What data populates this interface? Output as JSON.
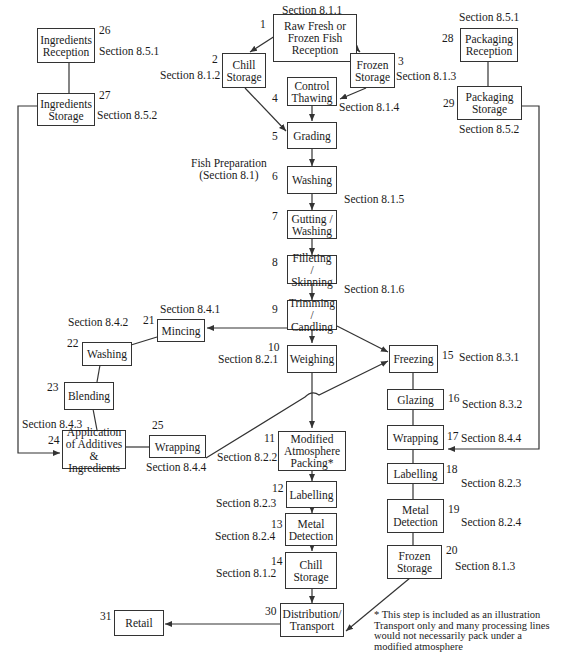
{
  "diagram": {
    "group_label": "Fish Preparation\n(Section 8.1)",
    "footnote": "* This step is included as an illustration Transport only and many processing lines would not necessarily pack under a modified atmosphere",
    "nodes": [
      {
        "id": 1,
        "num": "1",
        "label": "Raw Fresh or Frozen Fish Reception",
        "section": "Section 8.1.1"
      },
      {
        "id": 2,
        "num": "2",
        "label": "Chill Storage",
        "section": "Section 8.1.2"
      },
      {
        "id": 3,
        "num": "3",
        "label": "Frozen Storage",
        "section": "Section 8.1.3"
      },
      {
        "id": 4,
        "num": "4",
        "label": "Control Thawing",
        "section": "Section 8.1.4"
      },
      {
        "id": 5,
        "num": "5",
        "label": "Grading",
        "section": ""
      },
      {
        "id": 6,
        "num": "6",
        "label": "Washing",
        "section": ""
      },
      {
        "id": 7,
        "num": "7",
        "label": "Gutting / Washing",
        "section": "Section 8.1.5"
      },
      {
        "id": 8,
        "num": "8",
        "label": "Filleting / Skinning",
        "section": "Section 8.1.6"
      },
      {
        "id": 9,
        "num": "9",
        "label": "Trimming / Candling",
        "section": ""
      },
      {
        "id": 10,
        "num": "10",
        "label": "Weighing",
        "section": "Section 8.2.1"
      },
      {
        "id": 11,
        "num": "11",
        "label": "Modified Atmosphere Packing*",
        "section": "Section 8.2.2"
      },
      {
        "id": 12,
        "num": "12",
        "label": "Labelling",
        "section": "Section 8.2.3"
      },
      {
        "id": 13,
        "num": "13",
        "label": "Metal Detection",
        "section": "Section 8.2.4"
      },
      {
        "id": 14,
        "num": "14",
        "label": "Chill Storage",
        "section": "Section 8.1.2"
      },
      {
        "id": 15,
        "num": "15",
        "label": "Freezing",
        "section": "Section 8.3.1"
      },
      {
        "id": 16,
        "num": "16",
        "label": "Glazing",
        "section": "Section 8.3.2"
      },
      {
        "id": 17,
        "num": "17",
        "label": "Wrapping",
        "section": "Section 8.4.4"
      },
      {
        "id": 18,
        "num": "18",
        "label": "Labelling",
        "section": "Section 8.2.3"
      },
      {
        "id": 19,
        "num": "19",
        "label": "Metal Detection",
        "section": "Section 8.2.4"
      },
      {
        "id": 20,
        "num": "20",
        "label": "Frozen Storage",
        "section": "Section 8.1.3"
      },
      {
        "id": 21,
        "num": "21",
        "label": "Mincing",
        "section": "Section 8.4.1"
      },
      {
        "id": 22,
        "num": "22",
        "label": "Washing",
        "section": "Section 8.4.2"
      },
      {
        "id": 23,
        "num": "23",
        "label": "Blending",
        "section": ""
      },
      {
        "id": 24,
        "num": "24",
        "label": "Application of Additives & Ingredients",
        "section": "Section 8.4.3"
      },
      {
        "id": 25,
        "num": "25",
        "label": "Wrapping",
        "section": "Section 8.4.4"
      },
      {
        "id": 26,
        "num": "26",
        "label": "Ingredients Reception",
        "section": "Section 8.5.1"
      },
      {
        "id": 27,
        "num": "27",
        "label": "Ingredients Storage",
        "section": "Section 8.5.2"
      },
      {
        "id": 28,
        "num": "28",
        "label": "Packaging Reception",
        "section": "Section 8.5.1"
      },
      {
        "id": 29,
        "num": "29",
        "label": "Packaging Storage",
        "section": "Section 8.5.2"
      },
      {
        "id": 30,
        "num": "30",
        "label": "Distribution/ Transport",
        "section": ""
      },
      {
        "id": 31,
        "num": "31",
        "label": "Retail",
        "section": ""
      }
    ],
    "edges": [
      [
        1,
        2
      ],
      [
        1,
        3
      ],
      [
        3,
        4
      ],
      [
        2,
        5
      ],
      [
        4,
        5
      ],
      [
        5,
        6
      ],
      [
        6,
        7
      ],
      [
        7,
        8
      ],
      [
        8,
        9
      ],
      [
        9,
        10
      ],
      [
        9,
        21
      ],
      [
        9,
        15
      ],
      [
        10,
        11
      ],
      [
        11,
        12
      ],
      [
        12,
        13
      ],
      [
        13,
        14
      ],
      [
        14,
        30
      ],
      [
        15,
        16
      ],
      [
        16,
        17
      ],
      [
        17,
        18
      ],
      [
        18,
        19
      ],
      [
        19,
        20
      ],
      [
        20,
        30
      ],
      [
        30,
        31
      ],
      [
        21,
        22
      ],
      [
        22,
        23
      ],
      [
        23,
        24
      ],
      [
        24,
        25
      ],
      [
        25,
        15
      ],
      [
        26,
        27
      ],
      [
        27,
        24
      ],
      [
        28,
        29
      ],
      [
        29,
        17
      ]
    ]
  }
}
